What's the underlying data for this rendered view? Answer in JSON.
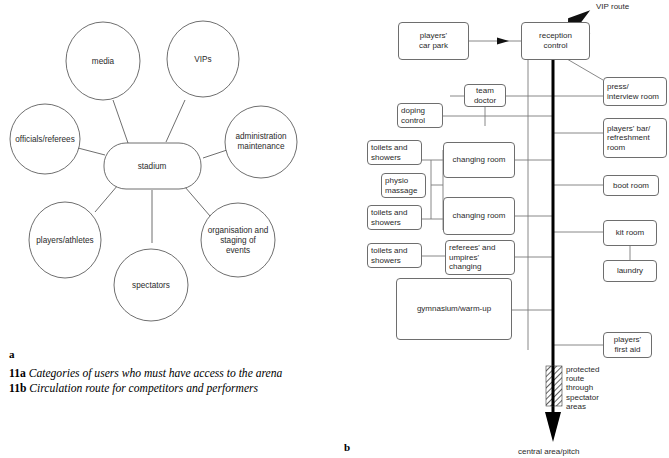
{
  "figure": {
    "letter_a": "a",
    "letter_b": "b",
    "captions": [
      {
        "num": "11a",
        "text": "Categories of users who must have access to the arena"
      },
      {
        "num": "11b",
        "text": "Circulation route for competitors and performers"
      }
    ]
  },
  "diagram_a": {
    "center": "stadium",
    "nodes": [
      "media",
      "VIPs",
      "officials/referees",
      "administration maintenance",
      "players/athletes",
      "organisation and staging of events",
      "spectators"
    ],
    "node_lines": {
      "media": [
        "media"
      ],
      "vips": [
        "VIPs"
      ],
      "officials": [
        "officials/referees"
      ],
      "administration": [
        "administration",
        "maintenance"
      ],
      "players": [
        "players/athletes"
      ],
      "organisation": [
        "organisation and",
        "staging of",
        "events"
      ],
      "spectators": [
        "spectators"
      ]
    }
  },
  "diagram_b": {
    "boxes": {
      "players_car_park": [
        "players'",
        "car park"
      ],
      "reception_control": [
        "reception",
        "control"
      ],
      "team_doctor": [
        "team",
        "doctor"
      ],
      "doping_control": [
        "doping",
        "control"
      ],
      "toilets_showers_1": [
        "toilets and",
        "showers"
      ],
      "toilets_showers_2": [
        "toilets and",
        "showers"
      ],
      "toilets_showers_3": [
        "toilets and",
        "showers"
      ],
      "physio_massage": [
        "physio",
        "massage"
      ],
      "changing_room_1": [
        "changing room"
      ],
      "changing_room_2": [
        "changing room"
      ],
      "referees_umpires_changing": [
        "referees' and",
        "umpires'",
        "changing"
      ],
      "gymnasium_warm_up": [
        "gymnasium/warm-up"
      ],
      "press_interview_room": [
        "press/",
        "interview room"
      ],
      "players_bar_refreshment": [
        "players' bar/",
        "refreshment",
        "room"
      ],
      "boot_room": [
        "boot room"
      ],
      "kit_room": [
        "kit room"
      ],
      "laundry": [
        "laundry"
      ],
      "players_first_aid": [
        "players'",
        "first aid"
      ]
    },
    "labels": {
      "vip_route": "VIP route",
      "protected_route": [
        "protected",
        "route",
        "through",
        "spectator",
        "areas"
      ],
      "central_area": "central area/pitch"
    }
  },
  "colors": {
    "ink": "#1a1a1a",
    "line": "#6e6e6e",
    "thick_route": "#000000",
    "paper": "#ffffff"
  }
}
